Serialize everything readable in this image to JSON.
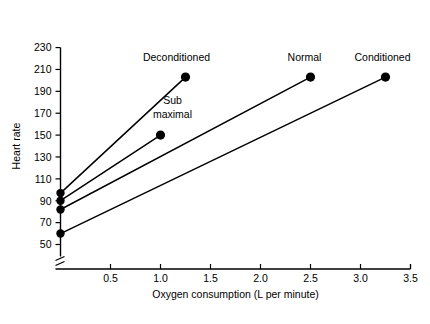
{
  "chart_data": {
    "type": "line",
    "title": "",
    "xlabel": "Oxygen consumption (L per minute)",
    "ylabel": "Heart rate",
    "xlim": [
      0,
      3.5
    ],
    "ylim": [
      50,
      230
    ],
    "grid": false,
    "legend_position": "inline-endpoint-labels",
    "axis_break_y": true,
    "xticks": [
      0.5,
      1.0,
      1.5,
      2.0,
      2.5,
      3.0,
      3.5
    ],
    "xtick_labels": [
      "0.5",
      "1.0",
      "1.5",
      "2.0",
      "2.5",
      "3.0",
      "3.5"
    ],
    "yticks": [
      50,
      70,
      90,
      110,
      130,
      150,
      170,
      190,
      210,
      230
    ],
    "ytick_labels": [
      "50",
      "70",
      "90",
      "110",
      "130",
      "150",
      "170",
      "190",
      "210",
      "230"
    ],
    "series": [
      {
        "name": "Deconditioned",
        "label": "Deconditioned",
        "points": [
          [
            0.0,
            97
          ],
          [
            1.25,
            203
          ]
        ],
        "endpoint_marker": true
      },
      {
        "name": "Sub maximal",
        "label": "Sub maximal",
        "points": [
          [
            0.0,
            90
          ],
          [
            1.0,
            150
          ]
        ],
        "endpoint_marker": true
      },
      {
        "name": "Normal",
        "label": "Normal",
        "points": [
          [
            0.0,
            82
          ],
          [
            2.5,
            203
          ]
        ],
        "endpoint_marker": true
      },
      {
        "name": "Conditioned",
        "label": "Conditioned",
        "points": [
          [
            0.0,
            60
          ],
          [
            3.25,
            203
          ]
        ],
        "endpoint_marker": true
      }
    ],
    "annotations": [
      {
        "text": "Deconditioned",
        "x": 1.16,
        "y": 218,
        "anchor": "middle"
      },
      {
        "text": "Sub",
        "x": 1.12,
        "y": 178,
        "anchor": "middle"
      },
      {
        "text": "maximal",
        "x": 1.12,
        "y": 166,
        "anchor": "middle"
      },
      {
        "text": "Normal",
        "x": 2.44,
        "y": 218,
        "anchor": "middle"
      },
      {
        "text": "Conditioned",
        "x": 3.22,
        "y": 218,
        "anchor": "middle"
      }
    ]
  },
  "colors": {
    "ink": "#000000",
    "background": "#ffffff"
  }
}
